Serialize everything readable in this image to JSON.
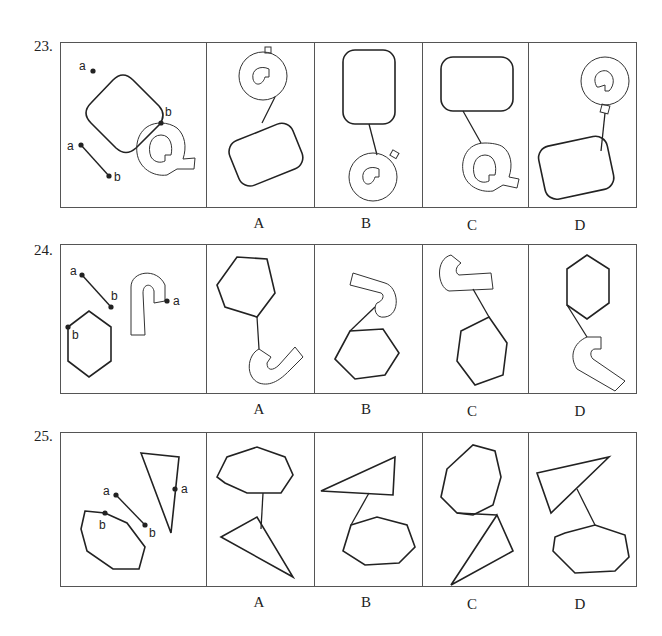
{
  "questions": [
    {
      "number": "23.",
      "given_labels": {
        "shape1_point": "a",
        "segment_start": "a",
        "segment_end": "b",
        "shape2_point": "b"
      },
      "given_shapes": [
        "rounded-rectangle",
        "segment-ab",
        "letter-Q"
      ],
      "options": [
        {
          "label": "A",
          "description": "Q above, rounded rectangle below, connected by line"
        },
        {
          "label": "B",
          "description": "Tall rounded rectangle above, Q below, connected by line"
        },
        {
          "label": "C",
          "description": "Wide rounded rectangle above, Q below, connected by line"
        },
        {
          "label": "D",
          "description": "Q above-right, rounded rectangle below, connected by line"
        }
      ]
    },
    {
      "number": "24.",
      "given_labels": {
        "segment_start": "a",
        "segment_end": "b",
        "hook_point": "a",
        "hexagon_point": "b"
      },
      "given_shapes": [
        "hexagon",
        "segment-ab",
        "hook-shape"
      ],
      "options": [
        {
          "label": "A",
          "description": "Hexagon above, hook below, connected by line"
        },
        {
          "label": "B",
          "description": "Hook above, hexagon below, connected by line"
        },
        {
          "label": "C",
          "description": "Hook above-left, hexagon below, connected by line"
        },
        {
          "label": "D",
          "description": "Hexagon above, hook below-right, connected by line"
        }
      ]
    },
    {
      "number": "25.",
      "given_labels": {
        "segment_start": "a",
        "segment_end": "b",
        "triangle_point": "a",
        "heptagon_point": "b"
      },
      "given_shapes": [
        "heptagon",
        "segment-ab",
        "triangle"
      ],
      "options": [
        {
          "label": "A",
          "description": "Heptagon above, triangle below, connected by line"
        },
        {
          "label": "B",
          "description": "Triangle above, heptagon below, connected by line"
        },
        {
          "label": "C",
          "description": "Heptagon above-left, triangle below, connected by line"
        },
        {
          "label": "D",
          "description": "Triangle above, heptagon below, connected by line"
        }
      ]
    }
  ]
}
